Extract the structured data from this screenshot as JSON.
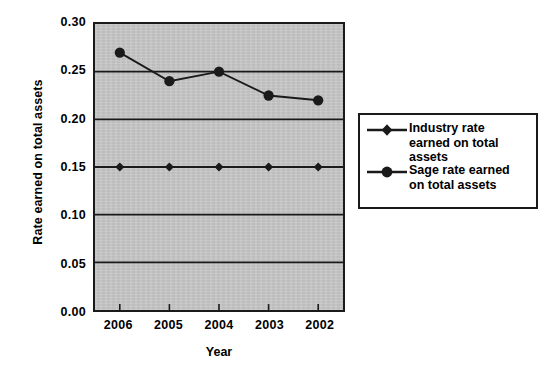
{
  "chart_data": {
    "type": "line",
    "title": "",
    "xlabel": "Year",
    "ylabel": "Rate earned on total assets",
    "categories": [
      "2006",
      "2005",
      "2004",
      "2003",
      "2002"
    ],
    "ylim": [
      0.0,
      0.3
    ],
    "ytick_labels": [
      "0.30",
      "0.25",
      "0.20",
      "0.15",
      "0.10",
      "0.05",
      "0.00"
    ],
    "ytick_values": [
      0.3,
      0.25,
      0.2,
      0.15,
      0.1,
      0.05,
      0.0
    ],
    "grid": "horizontal",
    "gridline_values": [
      0.25,
      0.2,
      0.15,
      0.1,
      0.05
    ],
    "legend_position": "right",
    "plot_background": "#c9c9c9",
    "line_color": "#1a1a1a",
    "series": [
      {
        "name": "Industry rate earned on total assets",
        "marker": "diamond",
        "values": [
          0.15,
          0.15,
          0.15,
          0.15,
          0.15
        ]
      },
      {
        "name": "Sage rate earned on total assets",
        "marker": "circle",
        "values": [
          0.27,
          0.24,
          0.25,
          0.225,
          0.22
        ]
      }
    ]
  },
  "legend": {
    "entries": [
      {
        "label": "Industry rate\nearned on total\nassets",
        "marker": "diamond-marker"
      },
      {
        "label": "Sage rate earned\non total assets",
        "marker": "circle-marker"
      }
    ]
  }
}
